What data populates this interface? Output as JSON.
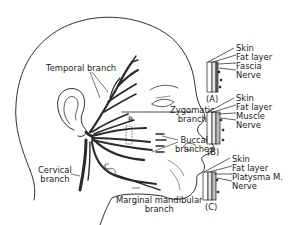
{
  "diagram": {
    "branch_labels": {
      "temporal": "Temporal branch",
      "zygomatic_line1": "Zygomatic",
      "zygomatic_line2": "branch",
      "buccal_line1": "Buccal",
      "buccal_line2": "branches",
      "cervical_line1": "Cervical",
      "cervical_line2": "branch",
      "marginal_line1": "Marginal mandibular",
      "marginal_line2": "branch"
    },
    "markers": {
      "b": "B",
      "c": "C"
    },
    "cross_sections": [
      {
        "id": "A",
        "label": "(A)",
        "layers": [
          "Skin",
          "Fat layer",
          "Fascia",
          "Nerve"
        ]
      },
      {
        "id": "B",
        "label": "(B)",
        "layers": [
          "Skin",
          "Fat layer",
          "Muscle",
          "Nerve"
        ]
      },
      {
        "id": "C",
        "label": "(C)",
        "layers": [
          "Skin",
          "Fat layer",
          "Platysma M.",
          "Nerve"
        ]
      }
    ],
    "colors": {
      "ink": "#1a1a1a",
      "nerve": "#2a2a2a",
      "background": "#ffffff"
    }
  }
}
